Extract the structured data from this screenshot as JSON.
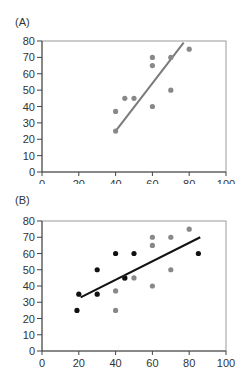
{
  "chart_data": [
    {
      "type": "scatter",
      "panel_label": "(A)",
      "title": "",
      "xlabel": "",
      "ylabel": "",
      "xlim": [
        0,
        100
      ],
      "ylim": [
        0,
        80
      ],
      "xticks": [
        0,
        20,
        40,
        60,
        80,
        100
      ],
      "yticks": [
        0,
        10,
        20,
        30,
        40,
        50,
        60,
        70,
        80
      ],
      "grid": false,
      "series": [
        {
          "name": "gray points",
          "color": "#888888",
          "points": [
            [
              40,
              25
            ],
            [
              40,
              37
            ],
            [
              45,
              45
            ],
            [
              50,
              45
            ],
            [
              60,
              40
            ],
            [
              60,
              65
            ],
            [
              60,
              70
            ],
            [
              70,
              50
            ],
            [
              70,
              70
            ],
            [
              80,
              75
            ]
          ]
        }
      ],
      "fit_line": {
        "color": "#7a7a7a",
        "from": [
          40,
          25
        ],
        "to": [
          77,
          79
        ]
      }
    },
    {
      "type": "scatter",
      "panel_label": "(B)",
      "title": "",
      "xlabel": "",
      "ylabel": "",
      "xlim": [
        0,
        100
      ],
      "ylim": [
        0,
        80
      ],
      "xticks": [
        0,
        20,
        40,
        60,
        80,
        100
      ],
      "yticks": [
        0,
        10,
        20,
        30,
        40,
        50,
        60,
        70,
        80
      ],
      "grid": false,
      "series": [
        {
          "name": "gray points",
          "color": "#888888",
          "points": [
            [
              40,
              25
            ],
            [
              40,
              37
            ],
            [
              45,
              45
            ],
            [
              50,
              45
            ],
            [
              60,
              40
            ],
            [
              60,
              65
            ],
            [
              60,
              70
            ],
            [
              70,
              50
            ],
            [
              70,
              70
            ],
            [
              80,
              75
            ]
          ]
        },
        {
          "name": "black points",
          "color": "#111111",
          "points": [
            [
              19,
              25
            ],
            [
              20,
              35
            ],
            [
              30,
              50
            ],
            [
              30,
              35
            ],
            [
              40,
              60
            ],
            [
              45,
              45
            ],
            [
              50,
              60
            ],
            [
              85,
              60
            ]
          ]
        }
      ],
      "fit_line": {
        "color": "#111111",
        "from": [
          21,
          33
        ],
        "to": [
          86,
          70
        ]
      }
    }
  ],
  "panels": {
    "a": {
      "label": "(A)"
    },
    "b": {
      "label": "(B)"
    }
  }
}
